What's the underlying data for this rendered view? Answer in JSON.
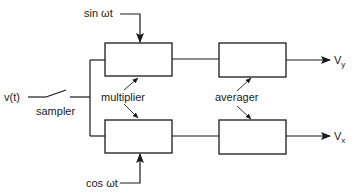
{
  "diagram": {
    "type": "block-diagram",
    "input_label": "v(t)",
    "sampler_label": "sampler",
    "multiplier_label": "multiplier",
    "averager_label": "averager",
    "reference_top": "sin ωt",
    "reference_bottom": "cos ωt",
    "output_top": {
      "main": "V",
      "subscript": "y"
    },
    "output_bottom": {
      "main": "V",
      "subscript": "x"
    },
    "blocks": [
      {
        "id": "multiplier-top",
        "role": "multiplier"
      },
      {
        "id": "multiplier-bottom",
        "role": "multiplier"
      },
      {
        "id": "averager-top",
        "role": "averager"
      },
      {
        "id": "averager-bottom",
        "role": "averager"
      }
    ],
    "colors": {
      "ink": "#1a1a1a",
      "background": "#ffffff"
    }
  }
}
